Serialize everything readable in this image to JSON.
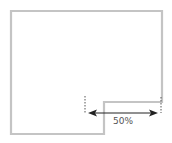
{
  "diagram": {
    "shape": "L-shaped floor outline with notch at bottom-right",
    "outline_color": "#c4c4c4",
    "dimension": {
      "label": "50%",
      "arrow_color": "#222222",
      "guide_color": "#555555"
    }
  }
}
